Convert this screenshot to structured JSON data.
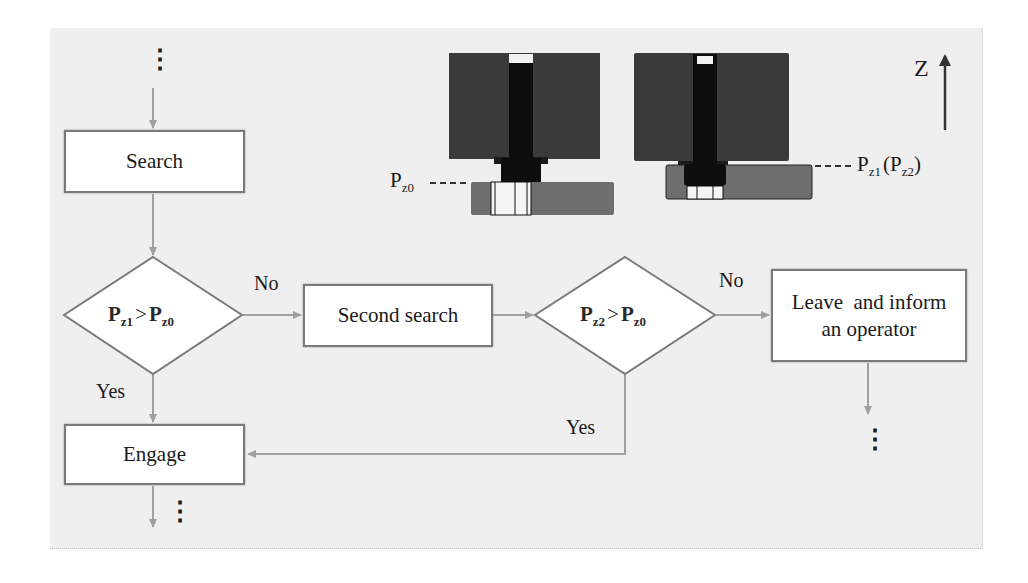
{
  "diagram": {
    "type": "flowchart",
    "axis_label": "Z",
    "colors": {
      "panel_bg": "#efefef",
      "box_border": "#7a7a7a",
      "connector": "#a0a0a0",
      "mech_dark": "#3a3a3a",
      "mech_shaft": "#0d0d0d",
      "mech_plate": "#6e6e6e"
    },
    "nodes": {
      "search": {
        "label": "Search",
        "shape": "rect"
      },
      "decision1": {
        "shape": "diamond",
        "p": "P",
        "sub_left": "z1",
        "op": ">",
        "sub_right": "z0"
      },
      "second_search": {
        "label": "Second search",
        "shape": "rect"
      },
      "decision2": {
        "shape": "diamond",
        "p": "P",
        "sub_left": "z2",
        "op": ">",
        "sub_right": "z0"
      },
      "leave": {
        "label_line1": "Leave  and inform",
        "label_line2": "an operator",
        "shape": "rect"
      },
      "engage": {
        "label": "Engage",
        "shape": "rect"
      }
    },
    "edges": {
      "d1_no": "No",
      "d1_yes": "Yes",
      "d2_no": "No",
      "d2_yes": "Yes"
    },
    "continuation": "⋮",
    "illustrations": {
      "left": {
        "label_p": "P",
        "label_sub": "z0"
      },
      "right": {
        "label_p": "P",
        "label_sub": "z1",
        "label_paren_open": "(P",
        "label_sub2": "z2",
        "label_paren_close": ")"
      }
    }
  }
}
